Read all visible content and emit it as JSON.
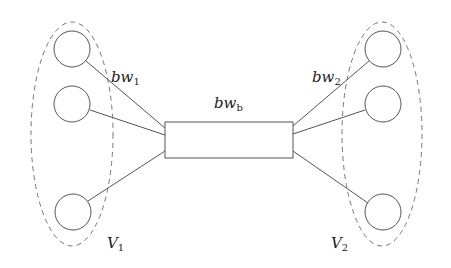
{
  "diagram": {
    "type": "network-topology",
    "colors": {
      "stroke": "#555555",
      "dashed": "#777777",
      "text": "#222222",
      "background": "#ffffff"
    },
    "groups": [
      {
        "id": "V1",
        "label": "V",
        "label_sub": "1",
        "node_count": 3,
        "link_label": "bw",
        "link_label_sub": "1"
      },
      {
        "id": "V2",
        "label": "V",
        "label_sub": "2",
        "node_count": 3,
        "link_label": "bw",
        "link_label_sub": "2"
      }
    ],
    "bottleneck": {
      "label": "bw",
      "label_sub": "b"
    }
  }
}
